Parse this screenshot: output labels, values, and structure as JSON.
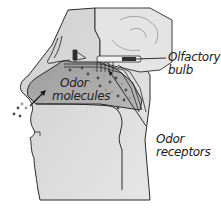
{
  "diagram": {
    "labels": {
      "olfactory_bulb_line1": "Olfactory",
      "olfactory_bulb_line2": "bulb",
      "odor_molecules_line1": "Odor",
      "odor_molecules_line2": "molecules",
      "odor_receptors_line1": "Odor",
      "odor_receptors_line2": "receptors"
    },
    "colors": {
      "head_fill": "#d4d4d4",
      "cavity_fill": "#a8a8a8",
      "brain_fill": "#e4e4e4",
      "outline": "#2a2a2a",
      "molecule_dark": "#4a4a4a",
      "molecule_light": "#9a9a9a"
    }
  }
}
